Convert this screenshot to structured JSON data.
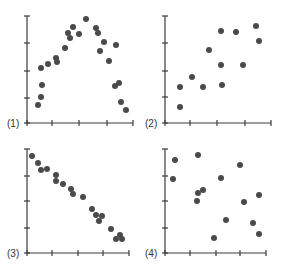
{
  "chart_data": [
    {
      "type": "scatter",
      "label": "(1)",
      "title": "",
      "xlabel": "",
      "ylabel": "",
      "description": "Curvilinear (inverted-U) relationship",
      "frame": {
        "x0": 27,
        "x1": 133,
        "y0": 123,
        "y1": 16
      },
      "xticks_px": [
        27,
        52,
        79,
        107,
        133
      ],
      "yticks_px": [
        123,
        98,
        71,
        43,
        16
      ],
      "points_px": [
        [
          38,
          105
        ],
        [
          41,
          97
        ],
        [
          42,
          85
        ],
        [
          41,
          68
        ],
        [
          48,
          64
        ],
        [
          56,
          58
        ],
        [
          57,
          62
        ],
        [
          65,
          48
        ],
        [
          68,
          33
        ],
        [
          70,
          38
        ],
        [
          73,
          27
        ],
        [
          79,
          34
        ],
        [
          86,
          19
        ],
        [
          96,
          28
        ],
        [
          98,
          33
        ],
        [
          100,
          51
        ],
        [
          104,
          42
        ],
        [
          109,
          61
        ],
        [
          116,
          45
        ],
        [
          115,
          86
        ],
        [
          119,
          83
        ],
        [
          121,
          102
        ],
        [
          126,
          110
        ]
      ]
    },
    {
      "type": "scatter",
      "label": "(2)",
      "title": "",
      "xlabel": "",
      "ylabel": "",
      "description": "Positive linear relationship (moderate)",
      "frame": {
        "x0": 165,
        "x1": 271,
        "y0": 123,
        "y1": 16
      },
      "xticks_px": [
        165,
        190,
        217,
        245,
        271
      ],
      "yticks_px": [
        123,
        97,
        71,
        43,
        16
      ],
      "points_px": [
        [
          180,
          107
        ],
        [
          180,
          87
        ],
        [
          192,
          77
        ],
        [
          203,
          87
        ],
        [
          209,
          50
        ],
        [
          221,
          31
        ],
        [
          221,
          65
        ],
        [
          222,
          85
        ],
        [
          236,
          32
        ],
        [
          243,
          65
        ],
        [
          256,
          26
        ],
        [
          259,
          41
        ]
      ]
    },
    {
      "type": "scatter",
      "label": "(3)",
      "title": "",
      "xlabel": "",
      "ylabel": "",
      "description": "Strong negative linear relationship",
      "frame": {
        "x0": 27,
        "x1": 129,
        "y0": 253,
        "y1": 149
      },
      "xticks_px": [
        27,
        52,
        78,
        103,
        129
      ],
      "yticks_px": [
        253,
        228,
        201,
        176,
        149
      ],
      "points_px": [
        [
          32,
          156
        ],
        [
          38,
          163
        ],
        [
          41,
          170
        ],
        [
          47,
          169
        ],
        [
          56,
          175
        ],
        [
          56,
          181
        ],
        [
          63,
          184
        ],
        [
          71,
          189
        ],
        [
          73,
          194
        ],
        [
          83,
          197
        ],
        [
          92,
          209
        ],
        [
          96,
          215
        ],
        [
          99,
          221
        ],
        [
          102,
          216
        ],
        [
          111,
          229
        ],
        [
          116,
          239
        ],
        [
          120,
          235
        ],
        [
          122,
          239
        ]
      ]
    },
    {
      "type": "scatter",
      "label": "(4)",
      "title": "",
      "xlabel": "",
      "ylabel": "",
      "description": "No apparent relationship",
      "frame": {
        "x0": 165,
        "x1": 266,
        "y0": 253,
        "y1": 149
      },
      "xticks_px": [
        165,
        190,
        216,
        240,
        266
      ],
      "yticks_px": [
        253,
        228,
        201,
        176,
        149
      ],
      "points_px": [
        [
          175,
          160
        ],
        [
          173,
          179
        ],
        [
          198,
          193
        ],
        [
          198,
          155
        ],
        [
          197,
          201
        ],
        [
          203,
          190
        ],
        [
          214,
          238
        ],
        [
          221,
          178
        ],
        [
          226,
          220
        ],
        [
          240,
          165
        ],
        [
          244,
          202
        ],
        [
          259,
          195
        ],
        [
          253,
          223
        ],
        [
          259,
          234
        ]
      ]
    }
  ],
  "style": {
    "dot_color": "#4a4a4a",
    "axis_color": "#3a3a3a",
    "dot_radius": 3
  }
}
